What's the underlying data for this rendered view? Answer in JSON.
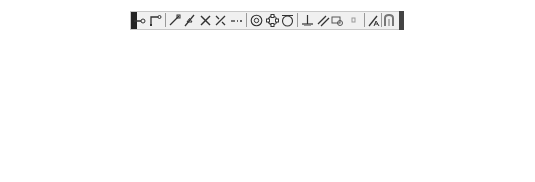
{
  "caption": "Midpoint between two points",
  "toolbar": {
    "buttons": [
      {
        "id": "temporary-track-point",
        "label": "Temporary track point",
        "x": 139,
        "side": "left",
        "y": 44
      },
      {
        "id": "snap-from",
        "label": "Snap From",
        "x": 155,
        "side": "left",
        "y": 59
      },
      {
        "id": "snap-endpoint",
        "label": "Snap to Endpoint",
        "x": 174,
        "side": "left",
        "y": 74
      },
      {
        "id": "snap-midpoint",
        "label": "Snap to Midpoint",
        "x": 189,
        "side": "left",
        "y": 91
      },
      {
        "id": "snap-intersection",
        "label": "Snap to Intersection",
        "x": 205,
        "side": "left",
        "y": 106
      },
      {
        "id": "snap-apparent-intersect",
        "label": "Snap to Apparent Intersect",
        "x": 220,
        "side": "left",
        "y": 122
      },
      {
        "id": "snap-extension",
        "label": "Snap to Extension",
        "x": 236,
        "side": "left",
        "y": 137
      },
      {
        "id": "snap-center",
        "label": "Snap to Center",
        "x": 256,
        "side": "left",
        "y": 154
      },
      {
        "id": "snap-quadrant",
        "label": "Snap to Quadrant",
        "x": 272,
        "side": "left",
        "y": 171
      },
      {
        "id": "snap-tangent",
        "label": "Snap to Tangent",
        "x": 287,
        "side": "right",
        "y": 154
      },
      {
        "id": "snap-perpendicular",
        "label": "Snap to Perpendicular",
        "x": 307,
        "side": "right",
        "y": 137
      },
      {
        "id": "snap-parallel",
        "label": "Snap to Parallel",
        "x": 323,
        "side": "right",
        "y": 122
      },
      {
        "id": "snap-insert",
        "label": "Snap to Insert",
        "x": 337,
        "side": "right",
        "y": 106
      },
      {
        "id": "snap-node",
        "label": "Snap to Node",
        "x": 353,
        "side": "right",
        "y": 91
      },
      {
        "id": "snap-nearest",
        "label": "Snap to Nearest",
        "x": 374,
        "side": "right",
        "y": 74
      },
      {
        "id": "snap-none",
        "label": "Snap to None",
        "x": 389,
        "side": "right",
        "y": 59
      },
      {
        "id": "osnap-settings",
        "label": "Osnap Settings",
        "x": 406,
        "side": "right",
        "y": 44
      }
    ]
  },
  "labels": {
    "temporary_track_point": "Temporary track point",
    "snap_from": "Snap From",
    "snap_endpoint": "Snap to Endpoint",
    "snap_midpoint": "Snap to Midpoint",
    "snap_intersection": "Snap to Intersection",
    "snap_apparent_intersect": "Snap to Apparent Intersect",
    "snap_extension": "Snap to Extension",
    "snap_center": "Snap to Center",
    "snap_quadrant": "Snap to Quadrant",
    "snap_tangent": "Snap to Tangent",
    "snap_perpendicular": "Snap to Perpendicular",
    "snap_parallel": "Snap to Parallel",
    "snap_insert": "Snap to Insert",
    "snap_node": "Snap to Node",
    "snap_nearest": "Snap to Nearest",
    "snap_none": "Snap to None",
    "osnap_settings": "Osnap Settings"
  }
}
